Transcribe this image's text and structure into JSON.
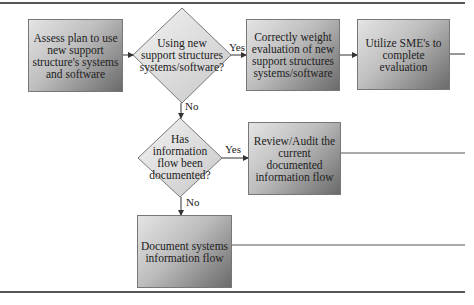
{
  "diagram": {
    "type": "flowchart",
    "nodes": {
      "assess": {
        "shape": "rectangle",
        "label": "Assess plan to use new support structure's systems and software"
      },
      "decision_new": {
        "shape": "diamond",
        "label": "Using new support structures systems/software?"
      },
      "weight": {
        "shape": "rectangle",
        "label": "Correctly weight evaluation of new support structures systems/software"
      },
      "sme": {
        "shape": "rectangle",
        "label": "Utilize SME's to complete evaluation"
      },
      "decision_documented": {
        "shape": "diamond",
        "label": "Has information flow been documented?"
      },
      "review": {
        "shape": "rectangle",
        "label": "Review/Audit the current documented information flow"
      },
      "document": {
        "shape": "rectangle",
        "label": "Document systems information flow"
      }
    },
    "edges": [
      {
        "from": "assess",
        "to": "decision_new",
        "label": ""
      },
      {
        "from": "decision_new",
        "to": "weight",
        "label": "Yes"
      },
      {
        "from": "weight",
        "to": "sme",
        "label": ""
      },
      {
        "from": "decision_new",
        "to": "decision_documented",
        "label": "No"
      },
      {
        "from": "decision_documented",
        "to": "review",
        "label": "Yes"
      },
      {
        "from": "decision_documented",
        "to": "document",
        "label": "No"
      }
    ],
    "edge_labels": {
      "yes1": "Yes",
      "no1": "No",
      "yes2": "Yes",
      "no2": "No"
    },
    "colors": {
      "rule": "#555555",
      "box_light": "#e4e4e4",
      "box_dark": "#6a6a6a",
      "line": "#333333"
    }
  }
}
